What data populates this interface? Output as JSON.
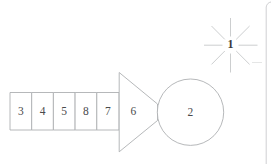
{
  "figure": {
    "background_color": "#ffffff",
    "line_color": "#aeb0b2",
    "text_color": "#4a4a4c",
    "accent_color": "#3a3a3c"
  },
  "cells": [
    {
      "label": "3",
      "name": "cell-3"
    },
    {
      "label": "4",
      "name": "cell-4"
    },
    {
      "label": "5",
      "name": "cell-5"
    },
    {
      "label": "8",
      "name": "cell-8"
    },
    {
      "label": "7",
      "name": "cell-7"
    }
  ],
  "trapezoid": {
    "label": "6"
  },
  "circle": {
    "label": "2"
  },
  "starburst": {
    "label": "1",
    "ray_count": 8
  },
  "page_border": {
    "present": true
  }
}
